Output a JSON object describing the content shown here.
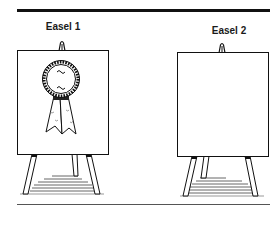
{
  "figure": {
    "easels": [
      {
        "label": "Easel 1",
        "content": "award-ribbon-rosette"
      },
      {
        "label": "Easel 2",
        "content": "blank"
      }
    ],
    "colors": {
      "ink": "#111111",
      "board": "#ffffff",
      "shadow": "#555555"
    }
  }
}
